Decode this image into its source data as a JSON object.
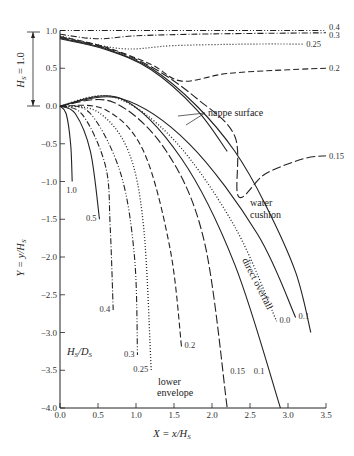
{
  "chart_data": {
    "type": "line",
    "title": "",
    "xlabel": "X = x/H_S",
    "ylabel": "Y = y/H_S",
    "xlim": [
      0.0,
      3.5
    ],
    "ylim": [
      -4.0,
      1.0
    ],
    "grid": false,
    "x_ticks": [
      "0.0",
      "0.5",
      "1.0",
      "1.5",
      "2.0",
      "2.5",
      "3.0",
      "3.5"
    ],
    "y_ticks": [
      "1.0",
      "0.5",
      "0.0",
      "-0.5",
      "-1.0",
      "-1.5",
      "-2.0",
      "-2.5",
      "-3.0",
      "-3.5",
      "-4.0"
    ],
    "parameter_label": "H_S/D_S",
    "head_annotation": "H_S = 1.0",
    "annotations": {
      "nappe_surface": "nappe surface",
      "water_cushion": "water cushion",
      "direct_overfall": "direct overfall",
      "lower_envelope": "lower envelope"
    },
    "upper_nappe": [
      {
        "name": "0.4",
        "points": [
          [
            0,
            1.0
          ],
          [
            3.5,
            1.0
          ]
        ]
      },
      {
        "name": "0.3",
        "points": [
          [
            0,
            0.95
          ],
          [
            0.5,
            0.89
          ],
          [
            1.0,
            0.93
          ],
          [
            2.0,
            0.955
          ],
          [
            3.5,
            0.97
          ]
        ]
      },
      {
        "name": "0.25",
        "points": [
          [
            0,
            0.93
          ],
          [
            0.8,
            0.76
          ],
          [
            1.5,
            0.8
          ],
          [
            2.5,
            0.82
          ],
          [
            3.2,
            0.82
          ]
        ]
      },
      {
        "name": "0.2",
        "points": [
          [
            0,
            0.92
          ],
          [
            0.6,
            0.78
          ],
          [
            1.2,
            0.55
          ],
          [
            1.6,
            0.33
          ],
          [
            2.2,
            0.43
          ],
          [
            3.0,
            0.48
          ],
          [
            3.5,
            0.5
          ]
        ]
      },
      {
        "name": "0.15",
        "points": [
          [
            0,
            0.91
          ],
          [
            0.6,
            0.77
          ],
          [
            1.2,
            0.52
          ],
          [
            1.8,
            0.1
          ],
          [
            2.3,
            -0.4
          ],
          [
            2.35,
            -1.2
          ],
          [
            2.7,
            -0.9
          ],
          [
            3.2,
            -0.7
          ],
          [
            3.5,
            -0.66
          ]
        ]
      }
    ],
    "nappe_surface_lines": [
      {
        "name": "water_cushion_surface",
        "points": [
          [
            0,
            0.9
          ],
          [
            0.6,
            0.76
          ],
          [
            1.2,
            0.5
          ],
          [
            1.8,
            0.0
          ],
          [
            2.3,
            -0.6
          ],
          [
            2.7,
            -1.3
          ],
          [
            3.1,
            -2.2
          ],
          [
            3.3,
            -3.0
          ]
        ]
      },
      {
        "name": "direct_overfall_surface",
        "points": [
          [
            0,
            0.89
          ],
          [
            0.6,
            0.75
          ],
          [
            1.2,
            0.48
          ],
          [
            1.8,
            -0.05
          ],
          [
            2.2,
            -0.6
          ]
        ]
      }
    ],
    "lower_nappe": [
      {
        "name": "1.0",
        "style": "solid",
        "points": [
          [
            0,
            0
          ],
          [
            0.08,
            -0.1
          ],
          [
            0.14,
            -0.5
          ],
          [
            0.16,
            -1.0
          ]
        ]
      },
      {
        "name": "0.5",
        "style": "solid",
        "points": [
          [
            0,
            0
          ],
          [
            0.2,
            -0.1
          ],
          [
            0.4,
            -0.6
          ],
          [
            0.52,
            -1.5
          ]
        ]
      },
      {
        "name": "0.4",
        "style": "dashdot",
        "points": [
          [
            0,
            0
          ],
          [
            0.3,
            -0.12
          ],
          [
            0.6,
            -0.8
          ],
          [
            0.66,
            -1.6
          ],
          [
            0.7,
            -2.7
          ]
        ]
      },
      {
        "name": "0.3",
        "style": "dashdotdot",
        "points": [
          [
            0,
            0
          ],
          [
            0.4,
            -0.1
          ],
          [
            0.8,
            -0.9
          ],
          [
            0.98,
            -2.0
          ],
          [
            1.02,
            -3.3
          ]
        ]
      },
      {
        "name": "0.25",
        "style": "dotted",
        "points": [
          [
            0,
            0
          ],
          [
            0.5,
            -0.08
          ],
          [
            0.9,
            -0.6
          ],
          [
            1.1,
            -1.6
          ],
          [
            1.2,
            -3.5
          ]
        ]
      },
      {
        "name": "0.2",
        "style": "dashed",
        "points": [
          [
            0,
            0
          ],
          [
            0.6,
            -0.05
          ],
          [
            1.1,
            -0.6
          ],
          [
            1.45,
            -1.9
          ],
          [
            1.6,
            -3.2
          ]
        ]
      },
      {
        "name": "0.15",
        "style": "longdash",
        "points": [
          [
            0,
            0
          ],
          [
            0.7,
            0.05
          ],
          [
            1.4,
            -0.6
          ],
          [
            1.9,
            -1.8
          ],
          [
            2.2,
            -4.0
          ]
        ]
      },
      {
        "name": "0.1",
        "style": "solid",
        "points": [
          [
            0,
            0
          ],
          [
            0.8,
            0.1
          ],
          [
            1.6,
            -0.7
          ],
          [
            2.3,
            -2.1
          ],
          [
            2.9,
            -4.0
          ]
        ]
      },
      {
        "name": "0.0",
        "style": "dotted",
        "points": [
          [
            0,
            0
          ],
          [
            0.7,
            0.12
          ],
          [
            1.5,
            -0.45
          ],
          [
            2.3,
            -1.6
          ],
          [
            2.85,
            -2.85
          ]
        ]
      },
      {
        "name": "0.1_upper",
        "label": "0.1",
        "style": "solid",
        "points": [
          [
            0,
            0
          ],
          [
            0.8,
            0.1
          ],
          [
            1.7,
            -0.5
          ],
          [
            2.6,
            -1.7
          ],
          [
            3.1,
            -2.8
          ]
        ]
      }
    ]
  },
  "labels": {
    "hs": "H",
    "hs_sub": "S",
    "hs_eq": " = 1.0",
    "hsds_h": "H",
    "hsds_s1": "S",
    "hsds_mid": "/D",
    "hsds_s2": "S",
    "xlabel_main": "X = x/H",
    "xlabel_sub": "S",
    "ylabel_main": "Y = y/H",
    "ylabel_sub": "S",
    "nappe": "nappe surface",
    "water": "water",
    "cushion": "cushion",
    "direct": "direct overfall",
    "lower": "lower",
    "envelope": "envelope"
  }
}
